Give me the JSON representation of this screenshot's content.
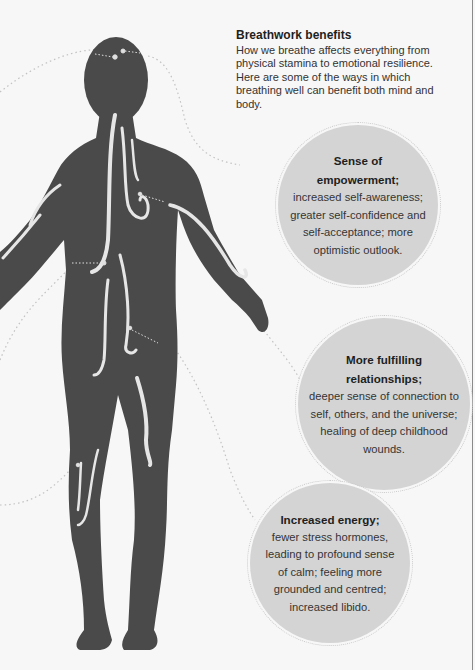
{
  "intro": {
    "title": "Breathwork benefits",
    "text": "How we breathe affects everything from physical stamina to emotional resilience. Here are some of the ways in which breathing well can benefit both mind and body."
  },
  "benefits": [
    {
      "title_line1": "Sense of",
      "title_line2": "empowerment;",
      "body": "increased self-awareness; greater self-confidence and self-acceptance; more optimistic outlook."
    },
    {
      "title_line1": "More fulfilling",
      "title_line2": "relationships;",
      "body": "deeper sense of connection to self, others, and the universe; healing of deep childhood wounds."
    },
    {
      "title_line1": "Increased energy;",
      "title_line2": "",
      "body": "fewer stress hormones, leading to profound sense of calm; feeling more grounded and centred; increased libido."
    }
  ],
  "figure": {
    "type": "human-silhouette",
    "icon": "human-body-icon",
    "colors": {
      "background": "#f7f7f7",
      "body": "#4a4a4a",
      "bubble": "#d4d4d4",
      "swirl": "#e8e8e8",
      "connector": "#bdbdbd"
    }
  }
}
